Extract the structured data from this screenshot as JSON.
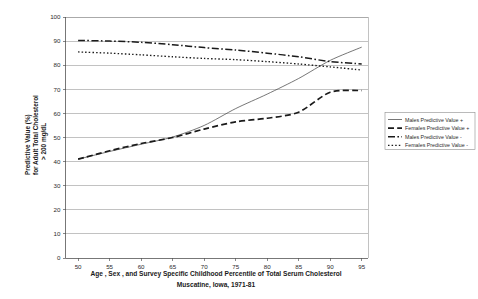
{
  "chart_data": {
    "type": "line",
    "title": "",
    "xlabel": "Age , Sex , and Survey Specific Childhood Percentile of Total Serum Cholesterol",
    "xlabel_line2": "Muscatine, Iowa, 1971-81",
    "ylabel": "Predictive Value (%)",
    "ylabel_line2": "for Adult Total Cholesterol",
    "ylabel_line3": "> 200 mg/dL",
    "xlim": [
      48,
      96
    ],
    "ylim": [
      0,
      100
    ],
    "grid": true,
    "legend_position": "right",
    "xticks": [
      50,
      55,
      60,
      65,
      70,
      75,
      80,
      85,
      90,
      95
    ],
    "yticks": [
      0,
      10,
      20,
      30,
      40,
      50,
      60,
      70,
      80,
      90,
      100
    ],
    "x": [
      50,
      55,
      60,
      65,
      70,
      75,
      80,
      85,
      90,
      95
    ],
    "series": [
      {
        "name": "Males Predictive Value +",
        "style": "solid",
        "values": [
          41.0,
          44.2,
          47.2,
          50.2,
          55.0,
          62.0,
          68.0,
          74.5,
          82.0,
          87.5
        ]
      },
      {
        "name": "Females Predictive Value +",
        "style": "long-dash",
        "values": [
          41.0,
          44.5,
          47.5,
          50.0,
          53.5,
          56.5,
          58.0,
          60.5,
          68.8,
          69.5
        ]
      },
      {
        "name": "Males Predictive Value -",
        "style": "dash-dot",
        "values": [
          90.3,
          90.0,
          89.5,
          88.5,
          87.3,
          86.3,
          85.0,
          83.5,
          81.5,
          80.5
        ]
      },
      {
        "name": "Females Predictive Value -",
        "style": "dotted",
        "values": [
          85.5,
          85.0,
          84.3,
          83.5,
          82.8,
          82.3,
          81.5,
          80.5,
          79.3,
          78.0
        ]
      }
    ]
  },
  "legend": {
    "entries": [
      {
        "label": "Males Predictive Value +"
      },
      {
        "label": "Females Predictive Value +"
      },
      {
        "label": "Males Predictive Value -"
      },
      {
        "label": "Females Predictive Value -"
      }
    ]
  },
  "colors": {
    "ink": "#1a1a1a",
    "grid": "#9a9a9a",
    "axis": "#555555",
    "background": "#ffffff"
  }
}
